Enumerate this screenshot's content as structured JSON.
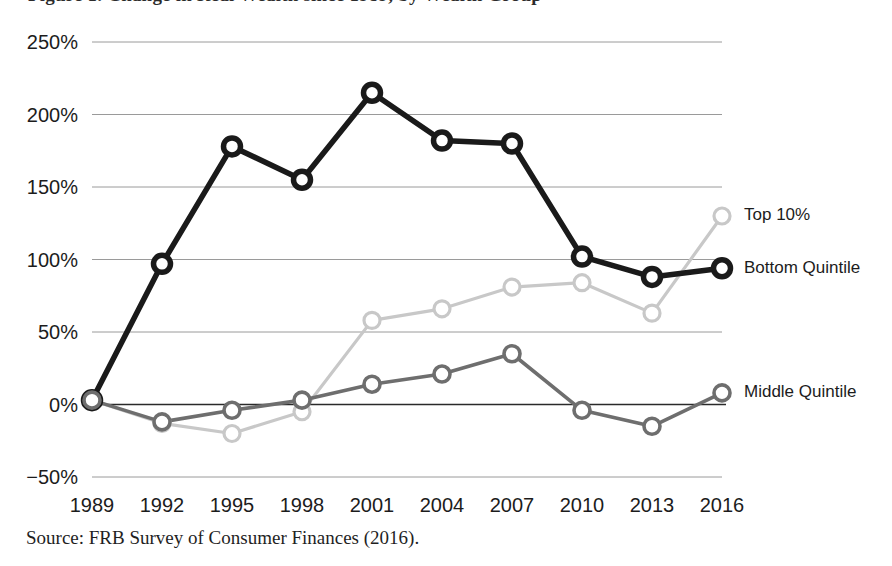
{
  "figure": {
    "title": "Figure 1. Change in Real Wealth since 1989, by Wealth Group",
    "source_note": "Source: FRB Survey of Consumer Finances (2016)."
  },
  "chart_data": {
    "type": "line",
    "title": "Change in Real Wealth since 1989, by Wealth Group",
    "xlabel": "",
    "ylabel": "",
    "categories": [
      "1989",
      "1992",
      "1995",
      "1998",
      "2001",
      "2004",
      "2007",
      "2010",
      "2013",
      "2016"
    ],
    "x": [
      1989,
      1992,
      1995,
      1998,
      2001,
      2004,
      2007,
      2010,
      2013,
      2016
    ],
    "ylim": [
      -50,
      250
    ],
    "yticks": [
      -50,
      0,
      50,
      100,
      150,
      200,
      250
    ],
    "ytick_labels": [
      "−50%",
      "0%",
      "50%",
      "100%",
      "150%",
      "200%",
      "250%"
    ],
    "xticks": [
      1989,
      1992,
      1995,
      1998,
      2001,
      2004,
      2007,
      2010,
      2013,
      2016
    ],
    "grid": true,
    "legend_position": "right-inline-labels",
    "unit": "percent",
    "series": [
      {
        "name": "Top 10%",
        "color": "#c8c8c8",
        "label_y_value": 130,
        "values": [
          3,
          -13,
          -20,
          -5,
          58,
          66,
          81,
          84,
          63,
          130
        ]
      },
      {
        "name": "Bottom Quintile",
        "color": "#1a1a1a",
        "label_y_value": 94,
        "values": [
          3,
          97,
          178,
          155,
          215,
          182,
          180,
          102,
          88,
          94
        ]
      },
      {
        "name": "Middle Quintile",
        "color": "#6e6e6e",
        "label_y_value": 8,
        "values": [
          3,
          -12,
          -4,
          3,
          14,
          21,
          35,
          -4,
          -15,
          8
        ]
      }
    ]
  }
}
